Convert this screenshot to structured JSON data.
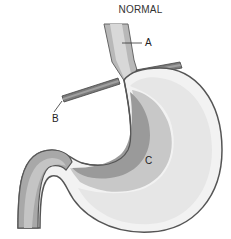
{
  "diagram": {
    "title": "NORMAL",
    "labels": {
      "a": "A",
      "b": "B",
      "c": "C"
    },
    "colors": {
      "wall_dark": "#8a8a8a",
      "wall_mid": "#a9a9a9",
      "inner_light": "#e3e3e3",
      "inner_mid": "#c9c9c9",
      "outline": "#555555",
      "background": "#ffffff"
    }
  }
}
